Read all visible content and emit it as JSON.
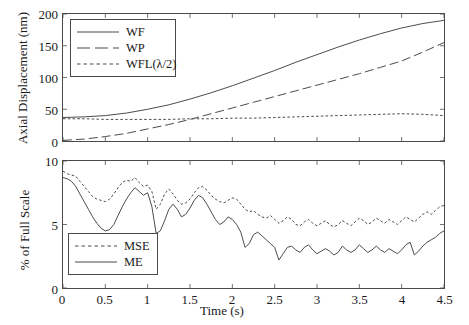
{
  "figure": {
    "background_color": "#ffffff",
    "line_color": "#4a4a4a",
    "axis_color": "#4a4a4a"
  },
  "chart_data": [
    {
      "type": "line",
      "panel": "top",
      "title": "",
      "xlabel": "",
      "ylabel": "Axial Displacement (nm)",
      "xlim": [
        0,
        4.5
      ],
      "ylim": [
        0,
        200
      ],
      "grid": false,
      "legend_position": "upper left",
      "yticks": [
        0,
        50,
        100,
        150,
        200
      ],
      "yticklabels": [
        "0",
        "50",
        "100",
        "150",
        "200"
      ],
      "xticks": [
        0,
        0.5,
        1,
        1.5,
        2,
        2.5,
        3,
        3.5,
        4,
        4.5
      ],
      "xticklabels": [
        "",
        "",
        "",
        "",
        "",
        "",
        "",
        "",
        "",
        ""
      ],
      "x": [
        0,
        0.25,
        0.5,
        0.75,
        1,
        1.25,
        1.5,
        1.75,
        2,
        2.25,
        2.5,
        2.75,
        3,
        3.25,
        3.5,
        3.75,
        4,
        4.25,
        4.5
      ],
      "series": [
        {
          "name": "WF",
          "style": "solid",
          "values": [
            37,
            38,
            40,
            44,
            50,
            57,
            66,
            76,
            87,
            99,
            111,
            124,
            136,
            148,
            159,
            169,
            178,
            185,
            190
          ]
        },
        {
          "name": "WP",
          "style": "long-dash",
          "values": [
            1,
            3,
            7,
            12,
            19,
            26,
            34,
            43,
            52,
            61,
            70,
            79,
            88,
            97,
            106,
            116,
            126,
            140,
            155
          ]
        },
        {
          "name": "WFL(λ/2)",
          "style": "short-dash",
          "values": [
            35,
            35,
            34,
            34,
            34,
            34,
            35,
            35,
            36,
            36,
            37,
            38,
            39,
            40,
            41,
            42,
            43,
            42,
            40
          ]
        }
      ]
    },
    {
      "type": "line",
      "panel": "bottom",
      "title": "",
      "xlabel": "Time (s)",
      "ylabel": "% of Full Scale",
      "xlim": [
        0,
        4.5
      ],
      "ylim": [
        0,
        10
      ],
      "grid": false,
      "legend_position": "lower left",
      "yticks": [
        0,
        5,
        10
      ],
      "yticklabels": [
        "0",
        "5",
        "10"
      ],
      "xticks": [
        0,
        0.5,
        1,
        1.5,
        2,
        2.5,
        3,
        3.5,
        4,
        4.5
      ],
      "xticklabels": [
        "0",
        "0.5",
        "1",
        "1.5",
        "2",
        "2.5",
        "3",
        "3.5",
        "4",
        "4.5"
      ],
      "x": [
        0,
        0.05,
        0.1,
        0.15,
        0.2,
        0.25,
        0.3,
        0.35,
        0.4,
        0.45,
        0.5,
        0.55,
        0.6,
        0.65,
        0.7,
        0.75,
        0.8,
        0.85,
        0.9,
        0.95,
        1,
        1.05,
        1.1,
        1.15,
        1.2,
        1.25,
        1.3,
        1.35,
        1.4,
        1.45,
        1.5,
        1.55,
        1.6,
        1.65,
        1.7,
        1.75,
        1.8,
        1.85,
        1.9,
        1.95,
        2,
        2.05,
        2.1,
        2.15,
        2.2,
        2.25,
        2.3,
        2.35,
        2.4,
        2.45,
        2.5,
        2.55,
        2.6,
        2.65,
        2.7,
        2.75,
        2.8,
        2.85,
        2.9,
        2.95,
        3,
        3.05,
        3.1,
        3.15,
        3.2,
        3.25,
        3.3,
        3.35,
        3.4,
        3.45,
        3.5,
        3.55,
        3.6,
        3.65,
        3.7,
        3.75,
        3.8,
        3.85,
        3.9,
        3.95,
        4,
        4.05,
        4.1,
        4.15,
        4.2,
        4.25,
        4.3,
        4.35,
        4.4,
        4.45,
        4.5
      ],
      "series": [
        {
          "name": "MSE",
          "style": "short-dash",
          "values": [
            9.2,
            9.0,
            8.9,
            8.8,
            8.4,
            8.0,
            7.6,
            7.2,
            7.0,
            6.9,
            6.8,
            7.0,
            7.4,
            7.9,
            8.3,
            8.5,
            8.4,
            8.7,
            8.3,
            8.0,
            8.1,
            7.6,
            6.2,
            6.6,
            7.4,
            7.8,
            7.4,
            6.9,
            6.6,
            6.7,
            7.0,
            7.5,
            7.9,
            8.0,
            7.7,
            7.3,
            7.0,
            6.8,
            6.7,
            6.9,
            7.1,
            7.0,
            6.6,
            6.2,
            6.0,
            6.1,
            5.8,
            5.6,
            5.5,
            5.7,
            5.4,
            5.1,
            5.3,
            5.6,
            5.4,
            5.0,
            4.9,
            5.2,
            5.4,
            5.1,
            4.9,
            5.1,
            5.3,
            5.0,
            4.8,
            5.0,
            5.3,
            5.1,
            4.9,
            5.2,
            5.5,
            5.3,
            5.0,
            5.2,
            5.5,
            5.3,
            5.1,
            5.4,
            5.2,
            5.0,
            5.3,
            5.6,
            5.4,
            5.2,
            5.5,
            5.8,
            6.0,
            5.8,
            6.1,
            6.4,
            6.5
          ]
        },
        {
          "name": "ME",
          "style": "solid",
          "values": [
            8.7,
            8.6,
            8.4,
            8.0,
            7.4,
            6.8,
            6.2,
            5.6,
            5.1,
            4.7,
            4.5,
            4.6,
            5.0,
            5.7,
            6.4,
            7.0,
            7.5,
            7.9,
            7.6,
            7.3,
            7.5,
            6.4,
            4.3,
            4.5,
            5.3,
            6.2,
            6.6,
            6.2,
            5.6,
            5.8,
            6.3,
            6.9,
            7.3,
            7.1,
            6.6,
            6.0,
            5.4,
            5.0,
            5.2,
            5.6,
            5.4,
            5.0,
            4.4,
            3.2,
            3.5,
            4.2,
            4.4,
            4.1,
            3.8,
            3.5,
            3.2,
            2.2,
            2.7,
            3.2,
            3.3,
            3.0,
            2.8,
            3.2,
            3.4,
            3.0,
            2.7,
            2.9,
            3.1,
            2.9,
            2.6,
            2.8,
            3.3,
            3.0,
            2.8,
            3.0,
            3.4,
            3.1,
            2.8,
            3.0,
            3.3,
            3.0,
            2.8,
            3.1,
            2.9,
            2.7,
            3.0,
            3.4,
            3.6,
            2.6,
            2.9,
            3.3,
            3.6,
            3.8,
            4.0,
            4.3,
            4.5
          ]
        }
      ]
    }
  ],
  "top_panel": {
    "ylabel": "Axial Displacement (nm)",
    "yticks": [
      "200",
      "150",
      "100",
      "50",
      "0"
    ],
    "legend": [
      {
        "label": "WF",
        "style": "solid"
      },
      {
        "label": "WP",
        "style": "long-dash"
      },
      {
        "label": "WFL(λ/2)",
        "style": "short-dash"
      }
    ]
  },
  "bottom_panel": {
    "ylabel": "% of Full Scale",
    "xlabel": "Time (s)",
    "yticks": [
      "10",
      "5",
      "0"
    ],
    "xticks": [
      "0",
      "0.5",
      "1",
      "1.5",
      "2",
      "2.5",
      "3",
      "3.5",
      "4",
      "4.5"
    ],
    "legend": [
      {
        "label": "MSE",
        "style": "short-dash"
      },
      {
        "label": "ME",
        "style": "solid"
      }
    ]
  }
}
